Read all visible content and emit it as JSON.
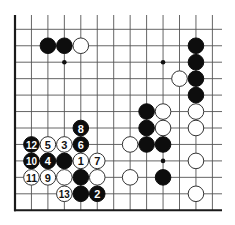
{
  "board": {
    "description": "Go board corner diagram (lower-left corner), 13 columns x 12 rows visible",
    "columns": 13,
    "rows": 12,
    "edges": [
      "left",
      "bottom"
    ],
    "colors": {
      "black_stone": "#0d0d0d",
      "white_stone": "#ffffff",
      "line": "#555555",
      "edge": "#1a1a1a"
    }
  },
  "star_points": [
    {
      "col": 3,
      "row": 2
    },
    {
      "col": 9,
      "row": 2
    },
    {
      "col": 9,
      "row": 8
    }
  ],
  "stones": [
    {
      "color": "black",
      "col": 2,
      "row": 1,
      "label": ""
    },
    {
      "color": "black",
      "col": 3,
      "row": 1,
      "label": ""
    },
    {
      "color": "white",
      "col": 4,
      "row": 1,
      "label": ""
    },
    {
      "color": "black",
      "col": 11,
      "row": 1,
      "label": ""
    },
    {
      "color": "black",
      "col": 11,
      "row": 2,
      "label": ""
    },
    {
      "color": "black",
      "col": 11,
      "row": 3,
      "label": ""
    },
    {
      "color": "black",
      "col": 11,
      "row": 4,
      "label": ""
    },
    {
      "color": "white",
      "col": 10,
      "row": 3,
      "label": ""
    },
    {
      "color": "white",
      "col": 11,
      "row": 5,
      "label": ""
    },
    {
      "color": "white",
      "col": 11,
      "row": 6,
      "label": ""
    },
    {
      "color": "white",
      "col": 11,
      "row": 8,
      "label": ""
    },
    {
      "color": "white",
      "col": 11,
      "row": 10,
      "label": ""
    },
    {
      "color": "black",
      "col": 8,
      "row": 5,
      "label": ""
    },
    {
      "color": "white",
      "col": 9,
      "row": 5,
      "label": ""
    },
    {
      "color": "black",
      "col": 8,
      "row": 6,
      "label": ""
    },
    {
      "color": "white",
      "col": 9,
      "row": 6,
      "label": ""
    },
    {
      "color": "white",
      "col": 7,
      "row": 7,
      "label": ""
    },
    {
      "color": "black",
      "col": 8,
      "row": 7,
      "label": ""
    },
    {
      "color": "black",
      "col": 9,
      "row": 7,
      "label": ""
    },
    {
      "color": "white",
      "col": 7,
      "row": 9,
      "label": ""
    },
    {
      "color": "black",
      "col": 9,
      "row": 9,
      "label": ""
    },
    {
      "color": "black",
      "col": 4,
      "row": 6,
      "label": "8"
    },
    {
      "color": "black",
      "col": 1,
      "row": 7,
      "label": "12"
    },
    {
      "color": "white",
      "col": 2,
      "row": 7,
      "label": "5"
    },
    {
      "color": "white",
      "col": 3,
      "row": 7,
      "label": "3"
    },
    {
      "color": "black",
      "col": 4,
      "row": 7,
      "label": "6"
    },
    {
      "color": "black",
      "col": 1,
      "row": 8,
      "label": "10"
    },
    {
      "color": "black",
      "col": 2,
      "row": 8,
      "label": "4"
    },
    {
      "color": "black",
      "col": 3,
      "row": 8,
      "label": ""
    },
    {
      "color": "white",
      "col": 4,
      "row": 8,
      "label": "1"
    },
    {
      "color": "white",
      "col": 5,
      "row": 8,
      "label": "7"
    },
    {
      "color": "white",
      "col": 1,
      "row": 9,
      "label": "11"
    },
    {
      "color": "white",
      "col": 2,
      "row": 9,
      "label": "9"
    },
    {
      "color": "white",
      "col": 3,
      "row": 9,
      "label": ""
    },
    {
      "color": "black",
      "col": 4,
      "row": 9,
      "label": ""
    },
    {
      "color": "white",
      "col": 5,
      "row": 9,
      "label": ""
    },
    {
      "color": "white",
      "col": 3,
      "row": 10,
      "label": "13"
    },
    {
      "color": "black",
      "col": 4,
      "row": 10,
      "label": ""
    },
    {
      "color": "black",
      "col": 5,
      "row": 10,
      "label": "2"
    }
  ]
}
